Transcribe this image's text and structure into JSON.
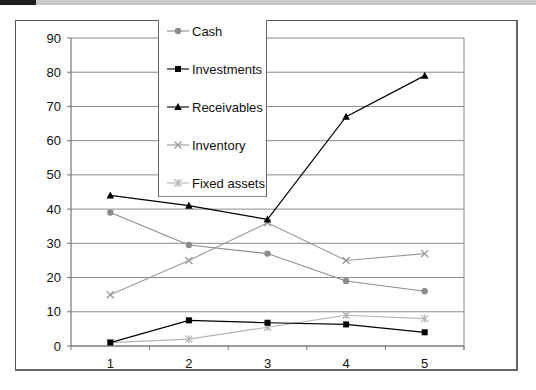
{
  "chart_data": {
    "type": "line",
    "title": "",
    "xlabel": "",
    "ylabel": "",
    "categories": [
      "1",
      "2",
      "3",
      "4",
      "5"
    ],
    "ylim": [
      0,
      90
    ],
    "yticks": [
      0,
      10,
      20,
      30,
      40,
      50,
      60,
      70,
      80,
      90
    ],
    "grid": true,
    "legend_position": "top-left (overlapping plot)",
    "series": [
      {
        "name": "Cash",
        "color": "#8c8c8c",
        "marker": "circle",
        "values": [
          39,
          29.5,
          27,
          19,
          16
        ]
      },
      {
        "name": "Investments",
        "color": "#000000",
        "marker": "square",
        "values": [
          1,
          7.5,
          6.8,
          6.3,
          4
        ]
      },
      {
        "name": "Receivables",
        "color": "#000000",
        "marker": "triangle",
        "values": [
          44,
          41,
          37,
          67,
          79
        ]
      },
      {
        "name": "Inventory",
        "color": "#9a9a9a",
        "marker": "x",
        "values": [
          15,
          25,
          36,
          25,
          27
        ]
      },
      {
        "name": "Fixed assets",
        "color": "#b4b4b4",
        "marker": "star",
        "values": [
          1,
          2,
          5.5,
          9,
          8
        ]
      }
    ]
  },
  "legend": {
    "items": [
      "Cash",
      "Investments",
      "Receivables",
      "Inventory",
      "Fixed assets"
    ]
  }
}
